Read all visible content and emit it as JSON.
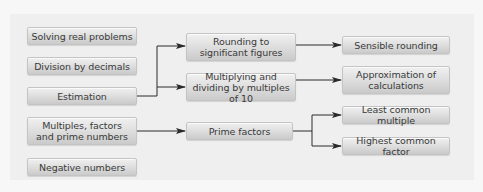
{
  "diagram": {
    "left_column": [
      {
        "id": "solving",
        "label": "Solving real problems"
      },
      {
        "id": "division",
        "label": "Division by decimals"
      },
      {
        "id": "estimation",
        "label": "Estimation"
      },
      {
        "id": "multiples",
        "label": "Multiples, factors and prime numbers"
      },
      {
        "id": "negative",
        "label": "Negative numbers"
      }
    ],
    "middle_column": [
      {
        "id": "rounding",
        "label": "Rounding to significant figures"
      },
      {
        "id": "multiplying",
        "label": "Multiplying and dividing by multiples of 10"
      },
      {
        "id": "prime",
        "label": "Prime factors"
      }
    ],
    "right_column": [
      {
        "id": "sensible",
        "label": "Sensible rounding"
      },
      {
        "id": "approximation",
        "label": "Approximation of calculations"
      },
      {
        "id": "lcm",
        "label": "Least common multiple"
      },
      {
        "id": "hcf",
        "label": "Highest common factor"
      }
    ],
    "connections": [
      {
        "from": "Estimation",
        "to": "Rounding to significant figures"
      },
      {
        "from": "Estimation",
        "to": "Multiplying and dividing by multiples of 10"
      },
      {
        "from": "Rounding to significant figures",
        "to": "Sensible rounding"
      },
      {
        "from": "Multiplying and dividing by multiples of 10",
        "to": "Approximation of calculations"
      },
      {
        "from": "Multiples, factors and prime numbers",
        "to": "Prime factors"
      },
      {
        "from": "Prime factors",
        "to": "Least common multiple"
      },
      {
        "from": "Prime factors",
        "to": "Highest common factor"
      }
    ],
    "colors": {
      "background": "#f7f7f7",
      "panel": "#efefef",
      "box_top": "#f0f0f0",
      "box_bottom": "#cacaca",
      "line": "#333333",
      "text": "#3a3a3a"
    }
  }
}
